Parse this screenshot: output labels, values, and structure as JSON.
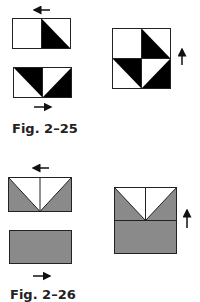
{
  "figures": [
    {
      "caption": "Fig. 2–25",
      "colors": {
        "fill": "#000000",
        "background": "#ffffff",
        "stroke": "#222222"
      },
      "pieces": [
        {
          "name": "top-unit",
          "arrow": "left"
        },
        {
          "name": "bottom-unit",
          "arrow": "right"
        },
        {
          "name": "assembled-block",
          "arrow": "up"
        }
      ]
    },
    {
      "caption": "Fig. 2–26",
      "colors": {
        "fill": "#8a8a8a",
        "background": "#ffffff",
        "stroke": "#222222"
      },
      "pieces": [
        {
          "name": "flying-geese-unit",
          "arrow": "left"
        },
        {
          "name": "plain-rectangle",
          "arrow": "right"
        },
        {
          "name": "assembled-block",
          "arrow": "up"
        }
      ]
    }
  ]
}
